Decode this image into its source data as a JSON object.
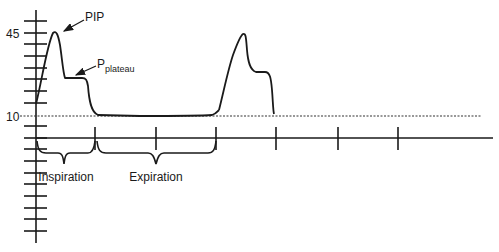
{
  "diagram": {
    "type": "ventilator-pressure-time-waveform",
    "y_axis": {
      "tick_labels": [
        {
          "label": "45",
          "y": 33
        },
        {
          "label": "10",
          "y": 116
        }
      ],
      "ticks_y": [
        21,
        33,
        44,
        56,
        68,
        79,
        91,
        103,
        126,
        138,
        149,
        161,
        173,
        184,
        196,
        208,
        219,
        231
      ]
    },
    "x_axis": {
      "ticks_x": [
        95,
        156,
        216,
        276,
        338,
        398
      ]
    },
    "reference_line": {
      "label": "10",
      "style": "dotted"
    },
    "annotations": {
      "pip": "PIP",
      "plateau_main": "P",
      "plateau_sub": "plateau"
    },
    "phases": {
      "inspiration": "Inspiration",
      "expiration": "Expiration"
    },
    "colors": {
      "line": "#1a1a1a",
      "background": "#ffffff"
    }
  }
}
